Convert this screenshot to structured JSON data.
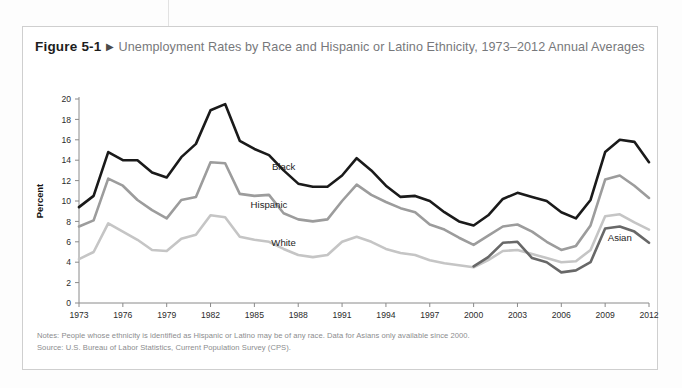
{
  "figure": {
    "number": "Figure 5-1",
    "arrow_glyph": "▶",
    "title": "Unemployment Rates by Race and Hispanic or Latino Ethnicity, 1973–2012 Annual Averages"
  },
  "notes": {
    "note": "Notes: People whose ethnicity is identified as Hispanic or Latino may be of any race. Data for Asians only available since 2000.",
    "source": "Source: U.S. Bureau of Labor Statistics, Current Population Survey (CPS)."
  },
  "colors": {
    "black_series": "#1a1a1a",
    "hispanic_series": "#9c9c9c",
    "white_series": "#c5c5c5",
    "asian_series": "#686868",
    "axis": "#8a8a8a",
    "card_border": "#cfcfcf",
    "title_gray": "#77787b"
  },
  "chart_data": {
    "type": "line",
    "title": "Unemployment Rates by Race and Hispanic or Latino Ethnicity, 1973–2012 Annual Averages",
    "xlabel": "",
    "ylabel": "Percent",
    "xlim": [
      1973,
      2012
    ],
    "ylim": [
      0,
      20
    ],
    "ytick_step": 2,
    "yticks": [
      0,
      2,
      4,
      6,
      8,
      10,
      12,
      14,
      16,
      18,
      20
    ],
    "xticks": [
      1973,
      1976,
      1979,
      1982,
      1985,
      1988,
      1991,
      1994,
      1997,
      2000,
      2003,
      2006,
      2009,
      2012
    ],
    "grid": false,
    "legend": "inline-labels",
    "x": [
      1973,
      1974,
      1975,
      1976,
      1977,
      1978,
      1979,
      1980,
      1981,
      1982,
      1983,
      1984,
      1985,
      1986,
      1987,
      1988,
      1989,
      1990,
      1991,
      1992,
      1993,
      1994,
      1995,
      1996,
      1997,
      1998,
      1999,
      2000,
      2001,
      2002,
      2003,
      2004,
      2005,
      2006,
      2007,
      2008,
      2009,
      2010,
      2011,
      2012
    ],
    "series": [
      {
        "name": "Black",
        "color": "#1a1a1a",
        "label_x": 1987,
        "label_y": 13.0,
        "values": [
          9.4,
          10.5,
          14.8,
          14.0,
          14.0,
          12.8,
          12.3,
          14.3,
          15.6,
          18.9,
          19.5,
          15.9,
          15.1,
          14.5,
          13.0,
          11.7,
          11.4,
          11.4,
          12.5,
          14.2,
          13.0,
          11.5,
          10.4,
          10.5,
          10.0,
          8.9,
          8.0,
          7.6,
          8.6,
          10.2,
          10.8,
          10.4,
          10.0,
          8.9,
          8.3,
          10.1,
          14.8,
          16.0,
          15.8,
          13.8
        ]
      },
      {
        "name": "Hispanic",
        "color": "#9c9c9c",
        "label_x": 1986,
        "label_y": 9.3,
        "values": [
          7.5,
          8.1,
          12.2,
          11.5,
          10.1,
          9.1,
          8.3,
          10.1,
          10.4,
          13.8,
          13.7,
          10.7,
          10.5,
          10.6,
          8.8,
          8.2,
          8.0,
          8.2,
          10.0,
          11.6,
          10.6,
          9.9,
          9.3,
          8.9,
          7.7,
          7.2,
          6.4,
          5.7,
          6.6,
          7.5,
          7.7,
          7.0,
          6.0,
          5.2,
          5.6,
          7.6,
          12.1,
          12.5,
          11.5,
          10.3
        ]
      },
      {
        "name": "White",
        "color": "#c5c5c5",
        "label_x": 1987,
        "label_y": 5.6,
        "values": [
          4.3,
          5.0,
          7.8,
          7.0,
          6.2,
          5.2,
          5.1,
          6.3,
          6.7,
          8.6,
          8.4,
          6.5,
          6.2,
          6.0,
          5.3,
          4.7,
          4.5,
          4.7,
          6.0,
          6.5,
          6.0,
          5.3,
          4.9,
          4.7,
          4.2,
          3.9,
          3.7,
          3.5,
          4.2,
          5.1,
          5.2,
          4.8,
          4.4,
          4.0,
          4.1,
          5.2,
          8.5,
          8.7,
          7.9,
          7.2
        ]
      },
      {
        "name": "Asian",
        "color": "#686868",
        "label_x": 2010,
        "label_y": 6.1,
        "start_year": 2000,
        "values": [
          null,
          null,
          null,
          null,
          null,
          null,
          null,
          null,
          null,
          null,
          null,
          null,
          null,
          null,
          null,
          null,
          null,
          null,
          null,
          null,
          null,
          null,
          null,
          null,
          null,
          null,
          null,
          3.6,
          4.5,
          5.9,
          6.0,
          4.4,
          4.0,
          3.0,
          3.2,
          4.0,
          7.3,
          7.5,
          7.0,
          5.9
        ]
      }
    ]
  }
}
